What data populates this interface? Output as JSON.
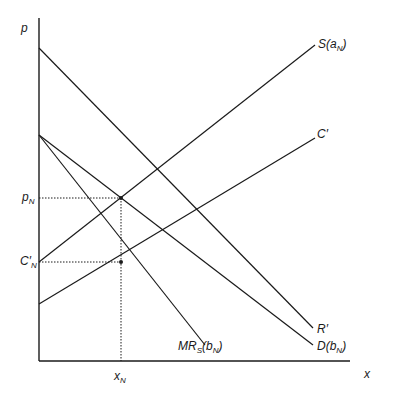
{
  "diagram": {
    "axes": {
      "y_label": "p",
      "x_label": "x"
    },
    "curves": [
      {
        "id": "S",
        "label_main": "S(a",
        "label_sub": "N",
        "label_end": ")"
      },
      {
        "id": "C_prime",
        "label_main": "C′",
        "label_sub": "",
        "label_end": ""
      },
      {
        "id": "R_prime",
        "label_main": "R′",
        "label_sub": "",
        "label_end": ""
      },
      {
        "id": "D",
        "label_main": "D(b",
        "label_sub": "N",
        "label_end": ")"
      },
      {
        "id": "MR_S",
        "label_main": "MR",
        "label_sub": "S",
        "label_end": "(b",
        "label_sub2": "N",
        "label_end2": ")"
      }
    ],
    "markers": {
      "p_N": {
        "main": "p",
        "sub": "N"
      },
      "C_prime_N": {
        "main": "C′",
        "sub": "N"
      },
      "x_N": {
        "main": "x",
        "sub": "N"
      }
    },
    "colors": {
      "line": "#1a1a1a",
      "background": "#ffffff"
    }
  }
}
